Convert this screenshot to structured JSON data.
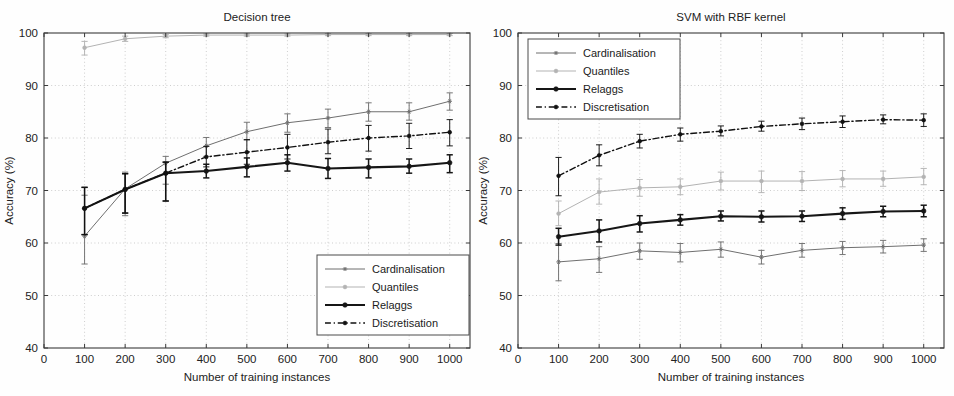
{
  "figure": {
    "background_color": "#fefefe",
    "axis_color": "#3a3a3a",
    "grid_color": "#b9b9b9"
  },
  "series_style": {
    "Cardinalisation": {
      "color": "#6f6f6f",
      "width": 1.0,
      "dash": "none",
      "marker": "asterisk"
    },
    "Quantiles": {
      "color": "#b3b3b3",
      "width": 1.0,
      "dash": "none",
      "marker": "circle"
    },
    "Relaggs": {
      "color": "#161616",
      "width": 2.1,
      "dash": "none",
      "marker": "circle"
    },
    "Discretisation": {
      "color": "#111111",
      "width": 1.4,
      "dash": "dashdot",
      "marker": "circle"
    }
  },
  "axis_common": {
    "xlabel": "Number of training instances",
    "ylabel": "Accuracy (%)",
    "xticks": [
      0,
      100,
      200,
      300,
      400,
      500,
      600,
      700,
      800,
      900,
      1000
    ],
    "yticks": [
      40,
      50,
      60,
      70,
      80,
      90,
      100
    ],
    "xlim": [
      0,
      1050
    ],
    "ylim": [
      40,
      100
    ],
    "grid": "dotted"
  },
  "chart_data": [
    {
      "id": "decision-tree",
      "type": "line",
      "title": "Decision tree",
      "xlabel": "Number of training instances",
      "ylabel": "Accuracy (%)",
      "xlim": [
        0,
        1050
      ],
      "ylim": [
        40,
        100
      ],
      "xticks": [
        0,
        100,
        200,
        300,
        400,
        500,
        600,
        700,
        800,
        900,
        1000
      ],
      "yticks": [
        40,
        50,
        60,
        70,
        80,
        90,
        100
      ],
      "grid": true,
      "legend_position": "lower-right",
      "x": [
        100,
        200,
        300,
        400,
        500,
        600,
        700,
        800,
        900,
        1000
      ],
      "series": [
        {
          "name": "Cardinalisation",
          "values": [
            61.3,
            70.3,
            75.2,
            78.5,
            81.2,
            82.9,
            83.8,
            85.0,
            85.0,
            87.0
          ],
          "err_low": [
            5.3,
            5.1,
            4.0,
            2.0,
            1.6,
            1.8,
            1.8,
            1.8,
            1.6,
            1.7
          ],
          "err_high": [
            7.8,
            3.2,
            1.3,
            1.6,
            1.8,
            1.7,
            1.7,
            1.7,
            1.7,
            1.6
          ]
        },
        {
          "name": "Quantiles",
          "values": [
            97.2,
            98.9,
            99.4,
            99.6,
            99.6,
            99.6,
            99.7,
            99.7,
            99.7,
            99.7
          ],
          "err_low": [
            1.4,
            0.5,
            0.3,
            0.2,
            0.2,
            0.2,
            0.2,
            0.2,
            0.2,
            0.2
          ],
          "err_high": [
            1.2,
            0.5,
            0.3,
            0.2,
            0.2,
            0.2,
            0.2,
            0.2,
            0.2,
            0.2
          ]
        },
        {
          "name": "Relaggs",
          "values": [
            66.6,
            70.2,
            73.3,
            73.7,
            74.5,
            75.3,
            74.2,
            74.4,
            74.6,
            75.3
          ],
          "err_low": [
            5.0,
            4.5,
            5.3,
            1.3,
            1.9,
            1.6,
            1.9,
            2.0,
            1.3,
            1.9
          ],
          "err_high": [
            4.0,
            3.0,
            2.1,
            1.3,
            1.7,
            1.5,
            1.9,
            1.6,
            1.4,
            1.5
          ]
        },
        {
          "name": "Discretisation",
          "values": [
            66.6,
            70.2,
            73.3,
            76.4,
            77.3,
            78.2,
            79.2,
            80.0,
            80.4,
            81.1
          ],
          "err_low": [
            5.0,
            4.5,
            5.3,
            1.9,
            2.3,
            2.2,
            2.2,
            2.5,
            2.4,
            2.6
          ],
          "err_high": [
            4.0,
            3.0,
            2.1,
            2.0,
            2.4,
            2.5,
            2.5,
            2.4,
            2.4,
            2.4
          ]
        }
      ]
    },
    {
      "id": "svm-rbf",
      "type": "line",
      "title": "SVM  with RBF kernel",
      "xlabel": "Number of training instances",
      "ylabel": "Accuracy (%)",
      "xlim": [
        0,
        1050
      ],
      "ylim": [
        40,
        100
      ],
      "xticks": [
        0,
        100,
        200,
        300,
        400,
        500,
        600,
        700,
        800,
        900,
        1000
      ],
      "yticks": [
        40,
        50,
        60,
        70,
        80,
        90,
        100
      ],
      "grid": true,
      "legend_position": "upper-left",
      "x": [
        100,
        200,
        300,
        400,
        500,
        600,
        700,
        800,
        900,
        1000
      ],
      "series": [
        {
          "name": "Cardinalisation",
          "values": [
            56.4,
            57.0,
            58.5,
            58.2,
            58.8,
            57.3,
            58.6,
            59.1,
            59.3,
            59.6
          ],
          "err_low": [
            3.6,
            2.6,
            1.6,
            1.8,
            1.5,
            1.3,
            1.3,
            1.3,
            1.2,
            1.2
          ],
          "err_high": [
            3.5,
            2.3,
            1.5,
            1.7,
            1.4,
            1.3,
            1.3,
            1.2,
            1.2,
            1.2
          ]
        },
        {
          "name": "Quantiles",
          "values": [
            65.6,
            69.7,
            70.5,
            70.7,
            71.8,
            71.8,
            71.8,
            72.2,
            72.2,
            72.6
          ],
          "err_low": [
            2.3,
            2.3,
            1.6,
            1.5,
            1.7,
            2.2,
            1.8,
            1.5,
            1.4,
            1.5
          ],
          "err_high": [
            2.4,
            2.5,
            1.6,
            1.5,
            1.7,
            1.9,
            1.8,
            1.6,
            1.5,
            1.6
          ]
        },
        {
          "name": "Relaggs",
          "values": [
            61.2,
            62.3,
            63.7,
            64.4,
            65.1,
            65.0,
            65.1,
            65.6,
            66.0,
            66.1
          ],
          "err_low": [
            1.6,
            2.1,
            1.6,
            1.0,
            0.9,
            1.0,
            1.0,
            1.1,
            1.0,
            1.1
          ],
          "err_high": [
            1.6,
            2.1,
            1.5,
            1.0,
            1.0,
            1.1,
            1.0,
            1.1,
            1.0,
            1.1
          ]
        },
        {
          "name": "Discretisation",
          "values": [
            72.8,
            76.7,
            79.4,
            80.7,
            81.3,
            82.2,
            82.7,
            83.1,
            83.5,
            83.4
          ],
          "err_low": [
            3.8,
            2.0,
            1.3,
            1.3,
            0.9,
            0.9,
            1.1,
            1.1,
            0.8,
            1.2
          ],
          "err_high": [
            3.5,
            2.0,
            1.3,
            1.2,
            1.0,
            1.0,
            1.1,
            1.1,
            0.9,
            1.2
          ]
        }
      ]
    }
  ],
  "legend": {
    "entries": [
      "Cardinalisation",
      "Quantiles",
      "Relaggs",
      "Discretisation"
    ]
  }
}
